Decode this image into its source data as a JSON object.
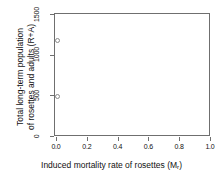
{
  "chart_data": {
    "type": "scatter",
    "title": "",
    "xlabel": "Induced mortality rate of rosettes (M_r)",
    "xlabel_main": "Induced mortality rate of rosettes (M",
    "xlabel_sub": "r",
    "xlabel_close": ")",
    "ylabel_line1": "Total long-term population",
    "ylabel_line2": "of rosettes and adults (R+A)",
    "xlim": [
      0,
      1.0
    ],
    "ylim": [
      0,
      1500
    ],
    "xticks": [
      "0.0",
      "0.2",
      "0.4",
      "0.6",
      "0.8",
      "1.0"
    ],
    "xtick_values": [
      0,
      0.2,
      0.4,
      0.6,
      0.8,
      1.0
    ],
    "yticks": [
      "0",
      "500",
      "1000",
      "1500"
    ],
    "ytick_values": [
      0,
      500,
      1000,
      1500
    ],
    "grid": false,
    "legend": null,
    "marker": "open-circle",
    "marker_color": "#8a8a8a",
    "points": [
      {
        "x": 0.012,
        "y": 1170
      },
      {
        "x": 0.012,
        "y": 490
      }
    ]
  },
  "colors": {
    "background": "#ffffff",
    "axis": "#6f6f6f",
    "text": "#111111",
    "marker": "#8a8a8a"
  }
}
